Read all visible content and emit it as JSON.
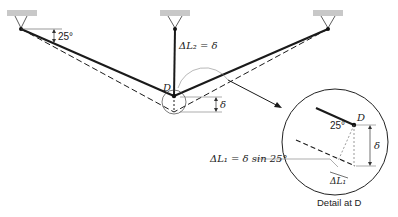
{
  "diagram": {
    "type": "three-bar truss deflection with detail view",
    "labels": {
      "angle_top": "25°",
      "delta_L2": "ΔL₂ = δ",
      "joint_D": "D",
      "delta_small": "δ",
      "detail_D": "D",
      "detail_angle": "25°",
      "detail_delta": "δ",
      "delta_L1_eq": "ΔL₁ = δ sin 25°",
      "delta_L1": "ΔL₁",
      "caption": "Detail at D"
    },
    "colors": {
      "line": "#1a1a1a",
      "support": "#c8c8c8",
      "thin": "#555555"
    }
  }
}
